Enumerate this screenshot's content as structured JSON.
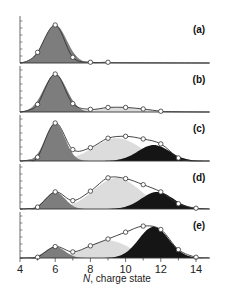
{
  "chart_data": {
    "type": "area",
    "title": "",
    "xlabel": "N, charge state",
    "xlabel_italic_part": "N",
    "xlabel_rest": ", charge state",
    "ylabel": "",
    "xlim": [
      4,
      15
    ],
    "xticks": [
      4,
      6,
      8,
      10,
      12,
      14
    ],
    "colors": {
      "low_component": "#7d7d7d",
      "mid_component": "#dcdcdc",
      "high_component": "#151515",
      "envelope": "#333333",
      "marker_face": "#ffffff"
    },
    "panels": [
      {
        "label": "(a)",
        "markers": {
          "x": [
            5,
            6,
            7,
            8,
            9
          ],
          "y": [
            0.28,
            1.0,
            0.15,
            0.02,
            0.02
          ]
        },
        "components": [
          {
            "name": "low",
            "center": 6.0,
            "width": 0.65,
            "amp": 1.0
          }
        ]
      },
      {
        "label": "(b)",
        "markers": {
          "x": [
            5,
            6,
            7,
            8,
            9,
            10,
            11,
            12
          ],
          "y": [
            0.2,
            1.0,
            0.22,
            0.07,
            0.12,
            0.12,
            0.08,
            0.02
          ]
        },
        "components": [
          {
            "name": "low",
            "center": 6.0,
            "width": 0.65,
            "amp": 1.0
          },
          {
            "name": "mid",
            "center": 9.6,
            "width": 1.4,
            "amp": 0.12
          }
        ]
      },
      {
        "label": "(c)",
        "markers": {
          "x": [
            5,
            6,
            7,
            8,
            9,
            10,
            11,
            12,
            13
          ],
          "y": [
            0.1,
            1.0,
            0.3,
            0.35,
            0.6,
            0.65,
            0.58,
            0.45,
            0.08
          ]
        },
        "components": [
          {
            "name": "low",
            "center": 6.0,
            "width": 0.55,
            "amp": 1.0
          },
          {
            "name": "mid",
            "center": 9.5,
            "width": 1.3,
            "amp": 0.6
          },
          {
            "name": "high",
            "center": 11.6,
            "width": 0.9,
            "amp": 0.42
          }
        ]
      },
      {
        "label": "(d)",
        "markers": {
          "x": [
            5,
            6,
            7,
            8,
            9,
            10,
            11,
            12,
            13,
            14
          ],
          "y": [
            0.05,
            0.45,
            0.22,
            0.47,
            0.82,
            0.8,
            0.64,
            0.45,
            0.14,
            0.02
          ]
        },
        "components": [
          {
            "name": "low",
            "center": 6.0,
            "width": 0.55,
            "amp": 0.45
          },
          {
            "name": "mid",
            "center": 9.5,
            "width": 1.3,
            "amp": 0.82
          },
          {
            "name": "high",
            "center": 11.8,
            "width": 0.9,
            "amp": 0.45
          }
        ]
      },
      {
        "label": "(e)",
        "markers": {
          "x": [
            5,
            6,
            7,
            8,
            9,
            10,
            11,
            12,
            13,
            14
          ],
          "y": [
            0.02,
            0.3,
            0.16,
            0.32,
            0.5,
            0.68,
            0.84,
            0.75,
            0.22,
            0.02
          ]
        },
        "components": [
          {
            "name": "low",
            "center": 6.0,
            "width": 0.55,
            "amp": 0.3
          },
          {
            "name": "mid",
            "center": 9.0,
            "width": 1.2,
            "amp": 0.46
          },
          {
            "name": "high",
            "center": 11.6,
            "width": 0.85,
            "amp": 0.82
          }
        ]
      }
    ]
  }
}
